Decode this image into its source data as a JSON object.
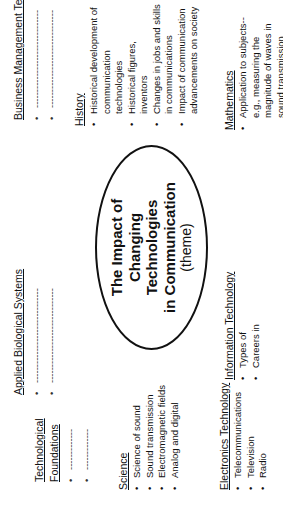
{
  "theme": {
    "lines": [
      "The Impact of",
      "Changing",
      "Technologies",
      "in Communication"
    ],
    "subtitle": "(theme)"
  },
  "technological_foundations": {
    "heading_line1": "Technological",
    "heading_line2": "Foundations",
    "items": [
      "-------------",
      "-------------"
    ]
  },
  "applied_biological_systems": {
    "heading": "Applied Biological Systems",
    "items": [
      "------------------------------",
      "------------------------------"
    ]
  },
  "business_management_technology": {
    "heading": "Business Management Technology",
    "items": [
      "-------------------------------",
      "-------------------------------"
    ]
  },
  "science": {
    "heading": "Science",
    "items": [
      "Science of sound",
      "Sound transmission",
      "Electromagnetic fields",
      "Analog and digital"
    ]
  },
  "history": {
    "heading": "History",
    "items": [
      "Historical development of communication technologies",
      "Historical figures, inventors",
      "Changes in jobs and skills in communications",
      "Impact of communication advancements on society"
    ]
  },
  "electronics_technology": {
    "heading": "Electronics Technology",
    "items": [
      "Telecommunications",
      "Television",
      "Radio"
    ]
  },
  "information_technology": {
    "heading": "Information Technology",
    "items": [
      "Types of",
      "Careers in"
    ]
  },
  "mathematics": {
    "heading": "Mathematics",
    "items": [
      "Application to subjects-- e.g., measuring the magnitude of waves in sound transmission"
    ]
  }
}
